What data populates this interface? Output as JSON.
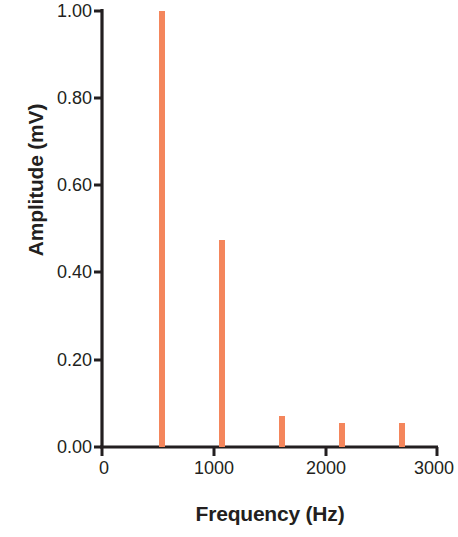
{
  "chart_data": {
    "type": "bar",
    "title": "",
    "xlabel": "Frequency (Hz)",
    "ylabel": "Amplitude (mV)",
    "xlim": [
      0,
      3000
    ],
    "ylim": [
      0.0,
      1.0
    ],
    "xticks": [
      0,
      1000,
      2000,
      3000
    ],
    "xtick_labels": [
      "0",
      "1000",
      "2000",
      "3000"
    ],
    "yticks": [
      0.0,
      0.2,
      0.4,
      0.6,
      0.8,
      1.0
    ],
    "ytick_labels": [
      "0.00",
      "0.20",
      "0.40",
      "0.60",
      "0.80",
      "1.00"
    ],
    "grid": false,
    "legend": null,
    "series": [
      {
        "name": "spectrum",
        "color": "#f4865c",
        "x": [
          537,
          1075,
          1615,
          2150,
          2690
        ],
        "values": [
          1.0,
          0.475,
          0.072,
          0.055,
          0.055
        ]
      }
    ]
  },
  "style": {
    "bar_color": "#f4865c",
    "axis_color": "#231f20",
    "text_color": "#231f20",
    "background": "#ffffff"
  }
}
